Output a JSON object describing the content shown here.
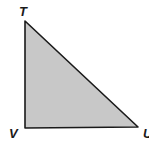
{
  "diagram": {
    "type": "right-triangle",
    "fill_color": "#c8c8c8",
    "stroke_color": "#1a1a1a",
    "vertices": [
      {
        "label": "T",
        "x": 25,
        "y": 21
      },
      {
        "label": "V",
        "x": 25,
        "y": 128
      },
      {
        "label": "U",
        "x": 138,
        "y": 127
      }
    ],
    "right_angle_at": "V"
  }
}
